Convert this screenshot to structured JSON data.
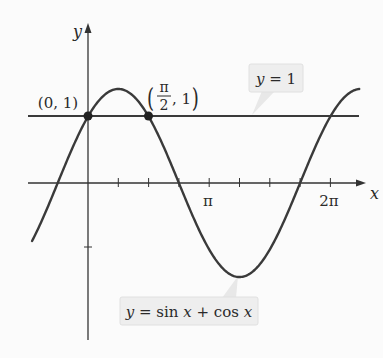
{
  "chart_data": {
    "type": "line",
    "title": "",
    "xlabel": "x",
    "ylabel": "y",
    "x_ticks": [
      {
        "value": 0.7854,
        "label": ""
      },
      {
        "value": 1.5708,
        "label": ""
      },
      {
        "value": 2.3562,
        "label": ""
      },
      {
        "value": 3.1416,
        "label": "π"
      },
      {
        "value": 3.927,
        "label": ""
      },
      {
        "value": 4.7124,
        "label": ""
      },
      {
        "value": 5.4978,
        "label": ""
      },
      {
        "value": 6.2832,
        "label": "2π"
      }
    ],
    "y_ticks": [
      {
        "value": -1,
        "label": ""
      }
    ],
    "xlim": [
      -1.45,
      7.15
    ],
    "ylim": [
      -2.4,
      2.4
    ],
    "grid": false,
    "series": [
      {
        "name": "y = sin x + cos x",
        "function": "sin(x)+cos(x)",
        "x_range": [
          -1.45,
          7.03
        ],
        "color": "#3a3a3a"
      },
      {
        "name": "y = 1",
        "function": "1",
        "x_range": [
          -1.55,
          7.03
        ],
        "color": "#3a3a3a"
      }
    ],
    "points": [
      {
        "x": 0,
        "y": 1,
        "label": "(0, 1)"
      },
      {
        "x": 1.5708,
        "y": 1,
        "label": "(π/2, 1)"
      }
    ],
    "annotations": [
      {
        "text": "y = 1",
        "target": "line"
      },
      {
        "text": "y = sin x + cos x",
        "target": "curve minimum"
      }
    ]
  },
  "labels": {
    "y_axis": "y",
    "x_axis": "x",
    "tick_pi": "π",
    "tick_2pi": "2π",
    "point_a": "(0, 1)",
    "point_b_num": "π",
    "point_b_den": "2",
    "point_b_rest": ", 1",
    "line_callout": "y = 1",
    "curve_callout": "y = sin x + cos x"
  },
  "colors": {
    "ink": "#2f2f2f",
    "callout_bg": "#f0f0f0",
    "callout_edge": "#d9d9d9"
  }
}
